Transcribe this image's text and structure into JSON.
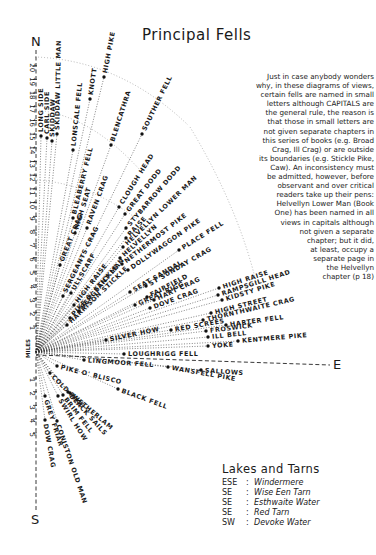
{
  "title": "Principal Fells",
  "compass": {
    "north": "N",
    "south": "S",
    "east": "E",
    "miles_label": "MILES"
  },
  "north_scale": [
    "1",
    "2",
    "3",
    "4",
    "5",
    "6",
    "7",
    "8",
    "9",
    "10",
    "11",
    "12",
    "13",
    "14",
    "15",
    "16",
    "17",
    "18",
    "19",
    "20"
  ],
  "south_scale": [
    "1",
    "2",
    "3",
    "4",
    "5"
  ],
  "note": "Just in case anybody wonders\nwhy, in these diagrams of views,\ncertain fells are named in small\nletters although CAPITALS are\nthe general rule, the reason is\nthat those in small letters are\nnot given separate chapters in\nthis series of books (e.g. Broad\nCrag, Ill Crag) or are outside\nits boundaries (e.g. Stickle Pike,\nCaw). An inconsistency must\nbe admitted, however, before\nobservant and over critical\nreaders take up their pens:\nHelvellyn Lower Man (Book\nOne) has been named in all\nviews in capitals although\nnot given a separate\nchapter; but it did,\nat least, occupy a\nseparate page in\nthe Helvellyn\nchapter (p 18)",
  "lakes": {
    "title": "Lakes and Tarns",
    "items": [
      {
        "dir": "ESE",
        "name": "Windermere"
      },
      {
        "dir": "SE",
        "name": "Wise Een Tarn"
      },
      {
        "dir": "SE",
        "name": "Esthwaite Water"
      },
      {
        "dir": "SE",
        "name": "Red Tarn"
      },
      {
        "dir": "SW",
        "name": "Devoke Water"
      }
    ]
  },
  "fells": [
    {
      "name": "LONG SIDE",
      "x": 41,
      "y": 136,
      "angle": -90
    },
    {
      "name": "CARL SIDE",
      "x": 47,
      "y": 138,
      "angle": -90
    },
    {
      "name": "SKIDDAW",
      "x": 52,
      "y": 141,
      "angle": -89
    },
    {
      "name": "SKIDDAW LITTLE MAN",
      "x": 57,
      "y": 134,
      "angle": -89
    },
    {
      "name": "LONSCALE FELL",
      "x": 73,
      "y": 150,
      "angle": -84
    },
    {
      "name": "KNOTT",
      "x": 90,
      "y": 99,
      "angle": -82
    },
    {
      "name": "HIGH PIKE",
      "x": 104,
      "y": 77,
      "angle": -79
    },
    {
      "name": "BLENCATHRA",
      "x": 111,
      "y": 145,
      "angle": -72
    },
    {
      "name": "SOUTHER FELL",
      "x": 142,
      "y": 134,
      "angle": -64
    },
    {
      "name": "BLEABERRY FELL",
      "x": 73,
      "y": 218,
      "angle": -76
    },
    {
      "name": "HIGH SEAT",
      "x": 75,
      "y": 233,
      "angle": -73
    },
    {
      "name": "RAVEN CRAG",
      "x": 87,
      "y": 228,
      "angle": -70
    },
    {
      "name": "CLOUGH HEAD",
      "x": 119,
      "y": 207,
      "angle": -58
    },
    {
      "name": "GREAT DODD",
      "x": 125,
      "y": 214,
      "angle": -52
    },
    {
      "name": "STYBARROW DODD",
      "x": 126,
      "y": 228,
      "angle": -49
    },
    {
      "name": "RAISE",
      "x": 126,
      "y": 238,
      "angle": -47
    },
    {
      "name": "HELVELLYN LOWER MAN",
      "x": 123,
      "y": 247,
      "angle": -44
    },
    {
      "name": "HELVELLYN",
      "x": 120,
      "y": 258,
      "angle": -42
    },
    {
      "name": "NETHERMOST PIKE",
      "x": 122,
      "y": 264,
      "angle": -38
    },
    {
      "name": "DOLLYWAGGON PIKE",
      "x": 128,
      "y": 270,
      "angle": -35
    },
    {
      "name": "PLACE FELL",
      "x": 179,
      "y": 250,
      "angle": -32
    },
    {
      "name": "GREAT CRAG",
      "x": 60,
      "y": 265,
      "angle": -68
    },
    {
      "name": "SERGEANTS CRAG",
      "x": 63,
      "y": 296,
      "angle": -64
    },
    {
      "name": "ULLSCARF",
      "x": 71,
      "y": 293,
      "angle": -60
    },
    {
      "name": "HIGH RAISE",
      "x": 74,
      "y": 305,
      "angle": -52
    },
    {
      "name": "SERGEANT MAN",
      "x": 79,
      "y": 311,
      "angle": -50
    },
    {
      "name": "PIKE O' STICKLE",
      "x": 70,
      "y": 318,
      "angle": -48
    },
    {
      "name": "HARRISON STICKLE",
      "x": 67,
      "y": 325,
      "angle": -44
    },
    {
      "name": "ST SUNDAY CRAG",
      "x": 146,
      "y": 286,
      "angle": -30
    },
    {
      "name": "SEAT SANDAL",
      "x": 130,
      "y": 292,
      "angle": -30
    },
    {
      "name": "FAIRFIELD",
      "x": 147,
      "y": 297,
      "angle": -28
    },
    {
      "name": "HART CRAG",
      "x": 154,
      "y": 300,
      "angle": -25
    },
    {
      "name": "GREAT RIGG",
      "x": 135,
      "y": 305,
      "angle": -24
    },
    {
      "name": "DOVE CRAG",
      "x": 150,
      "y": 308,
      "angle": -20
    },
    {
      "name": "HIGH RAISE",
      "x": 219,
      "y": 288,
      "angle": -18
    },
    {
      "name": "RAMPSGILL HEAD",
      "x": 218,
      "y": 295,
      "angle": -18
    },
    {
      "name": "KIDSTY PIKE",
      "x": 222,
      "y": 300,
      "angle": -17
    },
    {
      "name": "HIGH STREET",
      "x": 211,
      "y": 313,
      "angle": -14
    },
    {
      "name": "THORNTHWAITE CRAG",
      "x": 203,
      "y": 320,
      "angle": -13
    },
    {
      "name": "SILVER HOW",
      "x": 106,
      "y": 340,
      "angle": -12
    },
    {
      "name": "RED SCREES",
      "x": 171,
      "y": 330,
      "angle": -10
    },
    {
      "name": "HARTER FELL",
      "x": 226,
      "y": 325,
      "angle": -8
    },
    {
      "name": "FROSWICK",
      "x": 206,
      "y": 331,
      "angle": -7
    },
    {
      "name": "ILL BELL",
      "x": 208,
      "y": 337,
      "angle": -6
    },
    {
      "name": "KENTMERE PIKE",
      "x": 238,
      "y": 341,
      "angle": -5
    },
    {
      "name": "YOKE",
      "x": 208,
      "y": 346,
      "angle": -4
    },
    {
      "name": "LOUGHRIGG FELL",
      "x": 124,
      "y": 354,
      "angle": 0
    },
    {
      "name": "LINGMOOR FELL",
      "x": 84,
      "y": 360,
      "angle": 4
    },
    {
      "name": "SALLOWS",
      "x": 201,
      "y": 370,
      "angle": 4
    },
    {
      "name": "WANSFELL PIKE",
      "x": 168,
      "y": 367,
      "angle": 10
    },
    {
      "name": "PIKE O' BLISCO",
      "x": 57,
      "y": 366,
      "angle": 14
    },
    {
      "name": "BLACK FELL",
      "x": 118,
      "y": 389,
      "angle": 20
    },
    {
      "name": "COLD PIKE",
      "x": 50,
      "y": 373,
      "angle": 45
    },
    {
      "name": "WETHERLAM",
      "x": 70,
      "y": 393,
      "angle": 40
    },
    {
      "name": "GREY FRIAR",
      "x": 45,
      "y": 396,
      "angle": 72
    },
    {
      "name": "SWIRL HOW",
      "x": 58,
      "y": 396,
      "angle": 58
    },
    {
      "name": "BRIM FELL",
      "x": 63,
      "y": 395,
      "angle": 52
    },
    {
      "name": "DOW CRAG",
      "x": 45,
      "y": 420,
      "angle": 80
    },
    {
      "name": "CONISTON OLD MAN",
      "x": 57,
      "y": 421,
      "angle": 71
    },
    {
      "name": "BLACK SAILS",
      "x": 68,
      "y": 392,
      "angle": 48
    }
  ]
}
